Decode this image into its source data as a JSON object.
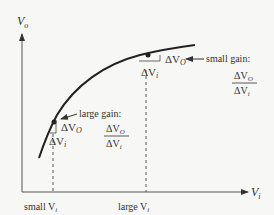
{
  "axes": {
    "y_label": "V",
    "y_label_sub": "o",
    "x_label": "V",
    "x_label_sub": "i"
  },
  "ticks": {
    "small": "small V",
    "small_sub": "i",
    "large": "large V",
    "large_sub": "i"
  },
  "upper_point": {
    "delta_vo": "ΔV",
    "delta_vo_sub": "O",
    "delta_vi": "ΔV",
    "delta_vi_sub": "i",
    "annotation": "small gain:",
    "frac_num": "ΔV",
    "frac_num_sub": "O",
    "frac_den": "ΔV",
    "frac_den_sub": "i"
  },
  "lower_point": {
    "delta_vo": "ΔV",
    "delta_vo_sub": "O",
    "delta_vi": "ΔV",
    "delta_vi_sub": "i",
    "annotation": "large gain:",
    "frac_num": "ΔV",
    "frac_num_sub": "O",
    "frac_den": "ΔV",
    "frac_den_sub": "i"
  },
  "colors": {
    "ink": "#333333",
    "background": "#f7f7f5"
  }
}
